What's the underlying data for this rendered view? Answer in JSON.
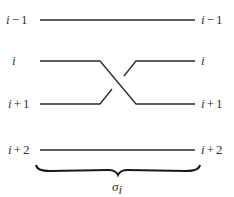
{
  "diagram": {
    "type": "braid-generator",
    "strands": [
      {
        "left_label": "i",
        "left_op": "−",
        "left_num": "1",
        "right_label": "i",
        "right_op": "−",
        "right_num": "1",
        "kind": "straight"
      },
      {
        "left_label": "i",
        "left_op": "",
        "left_num": "",
        "right_label": "i",
        "right_op": "",
        "right_num": "",
        "kind": "over-cross-down"
      },
      {
        "left_label": "i",
        "left_op": "+",
        "left_num": "1",
        "right_label": "i",
        "right_op": "+",
        "right_num": "1",
        "kind": "under-cross-up"
      },
      {
        "left_label": "i",
        "left_op": "+",
        "left_num": "2",
        "right_label": "i",
        "right_op": "+",
        "right_num": "2",
        "kind": "straight"
      }
    ],
    "brace_label": {
      "symbol": "σ",
      "subscript": "i"
    },
    "colors": {
      "stroke": "#2a2a2a",
      "text": "#333333",
      "background": "#ffffff"
    }
  }
}
